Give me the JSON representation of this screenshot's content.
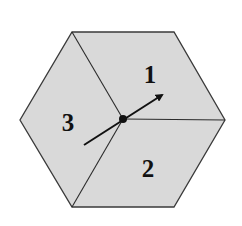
{
  "diagram": {
    "shape": "hexagon",
    "fill_color": "#d9d9d9",
    "stroke_color": "#3a3a3a",
    "faces": [
      {
        "id": "1",
        "label": "1"
      },
      {
        "id": "2",
        "label": "2"
      },
      {
        "id": "3",
        "label": "3"
      }
    ],
    "center_point": "origin-dot",
    "vector": "arrow-through-center"
  }
}
